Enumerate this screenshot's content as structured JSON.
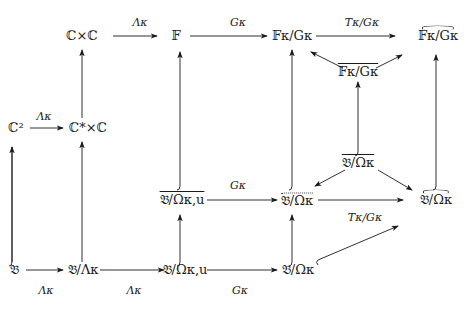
{
  "nodes": {
    "CxC": "ℂ×ℂ",
    "F": "𝔽",
    "F_sub": "κ",
    "F_G": "𝔽κ/Gκ",
    "F_G_hat": "𝔽κ/Gκ",
    "F_G_bar": "𝔽κ/Gκ",
    "C2": "ℂ²",
    "CstarxC": "ℂ*×ℂ",
    "B_Omega_bar": "𝔅/Ωκ",
    "B_Omega_u_bar": "𝔅/Ωκ,u",
    "B_Omega_dot": "𝔅/Ωκ",
    "B_Omega_hat": "𝔅/Ωκ",
    "B": "𝔅",
    "B_Lambda": "𝔅/Λκ",
    "B_Omega_u": "𝔅/Ωκ,u",
    "B_Omega": "𝔅/Ωκ"
  },
  "labels": {
    "top_Lambda": "Λκ",
    "top_G": "Gκ",
    "top_TG": "Tκ/Gκ",
    "left_Lambda": "Λκ",
    "mid_G": "Gκ",
    "mid_TG": "Tκ/Gκ",
    "bot_Lambda1": "Λκ",
    "bot_Lambda2": "Λκ",
    "bot_G": "Gκ"
  }
}
